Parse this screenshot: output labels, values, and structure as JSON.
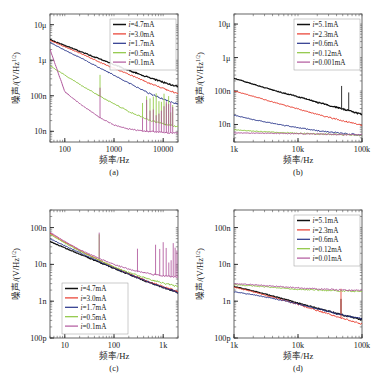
{
  "figure": {
    "axis_labels": {
      "x": "频率/Hz",
      "y": "噪声/(V/Hz",
      "y_sup": "1/2",
      "y_tail": ")"
    },
    "colors": {
      "series1": "#111111",
      "series2": "#e8392a",
      "series3": "#27348b",
      "series4": "#8cc63f",
      "series5": "#b0569c"
    }
  },
  "panels": [
    {
      "id": "a",
      "caption": "(a)",
      "legend_position": "top-right",
      "chart_data": {
        "type": "line",
        "title": "",
        "xlabel": "频率/Hz",
        "ylabel": "噪声/(V/Hz^1/2)",
        "xscale": "log",
        "yscale": "log",
        "xlim": [
          50,
          20000
        ],
        "ylim": [
          5e-09,
          2e-05
        ],
        "xticks": [
          100,
          1000,
          10000
        ],
        "xticklabels": [
          "100",
          "1000",
          "10000"
        ],
        "yticks": [
          1e-05,
          1e-06,
          1e-07,
          1e-08
        ],
        "yticklabels": [
          "10μ",
          "1μ",
          "100n",
          "10n"
        ],
        "grid": false,
        "series": [
          {
            "name": "i=4.7mA",
            "color": "#111111",
            "x": [
              50,
              100,
              200,
              500,
              1000,
              2000,
              5000,
              10000,
              20000
            ],
            "y": [
              3.8e-06,
              2.6e-06,
              1.8e-06,
              1.1e-06,
              7.6e-07,
              5.2e-07,
              3.3e-07,
              2.4e-07,
              1.8e-07
            ]
          },
          {
            "name": "i=3.0mA",
            "color": "#e8392a",
            "x": [
              50,
              100,
              200,
              500,
              1000,
              2000,
              5000,
              10000,
              20000
            ],
            "y": [
              3.6e-06,
              2.4e-06,
              1.6e-06,
              9e-07,
              6e-07,
              4e-07,
              2.3e-07,
              1.6e-07,
              1.15e-07
            ]
          },
          {
            "name": "i=1.7mA",
            "color": "#27348b",
            "x": [
              50,
              100,
              200,
              500,
              1000,
              2000,
              5000,
              10000,
              20000
            ],
            "y": [
              3.2e-06,
              1.9e-06,
              1.2e-06,
              6.2e-07,
              3.8e-07,
              2.3e-07,
              1.2e-07,
              8e-08,
              5.8e-08
            ]
          },
          {
            "name": "i=0.5mA",
            "color": "#8cc63f",
            "x": [
              50,
              100,
              200,
              500,
              1000,
              2000,
              5000,
              10000,
              20000
            ],
            "y": [
              7e-07,
              3.8e-07,
              2.1e-07,
              1e-07,
              6e-08,
              3.6e-08,
              2.1e-08,
              1.6e-08,
              1.35e-08
            ]
          },
          {
            "name": "i=0.1mA",
            "color": "#b0569c",
            "x": [
              50,
              100,
              200,
              500,
              1000,
              2000,
              5000,
              10000,
              20000
            ],
            "y": [
              2e-06,
              1.3e-07,
              6e-08,
              2.5e-08,
              1.5e-08,
              1.15e-08,
              9.8e-09,
              9.3e-09,
              9e-09
            ]
          }
        ],
        "legend": [
          "i=4.7mA",
          "i=3.0mA",
          "i=1.7mA",
          "i=0.5mA",
          "i=0.1mA"
        ],
        "legend_currents": [
          "4.7",
          "3.0",
          "1.7",
          "0.5",
          "0.1"
        ]
      }
    },
    {
      "id": "b",
      "caption": "(b)",
      "legend_position": "top-right",
      "chart_data": {
        "type": "line",
        "title": "",
        "xlabel": "频率/Hz",
        "ylabel": "噪声/(V/Hz^1/2)",
        "xscale": "log",
        "yscale": "log",
        "xlim": [
          1000,
          100000
        ],
        "ylim": [
          3e-09,
          2e-05
        ],
        "xticks": [
          1000,
          10000,
          100000
        ],
        "xticklabels": [
          "1k",
          "10k",
          "100k"
        ],
        "yticks": [
          1e-05,
          1e-06,
          1e-07,
          1e-08
        ],
        "yticklabels": [
          "10μ",
          "1μ",
          "100n",
          "10n"
        ],
        "grid": false,
        "series": [
          {
            "name": "i=5.1mA",
            "color": "#111111",
            "x": [
              1000,
              2000,
              5000,
              10000,
              20000,
              50000,
              100000
            ],
            "y": [
              2.4e-07,
              1.6e-07,
              9.5e-08,
              6.8e-08,
              4.6e-08,
              2.9e-08,
              2e-08
            ]
          },
          {
            "name": "i=2.3mA",
            "color": "#e8392a",
            "x": [
              1000,
              2000,
              5000,
              10000,
              20000,
              50000,
              100000
            ],
            "y": [
              1e-07,
              7e-08,
              4.2e-08,
              2.9e-08,
              2e-08,
              1.3e-08,
              9.5e-09
            ]
          },
          {
            "name": "i=0.6mA",
            "color": "#27348b",
            "x": [
              1000,
              2000,
              5000,
              10000,
              20000,
              50000,
              100000
            ],
            "y": [
              1.9e-08,
              1.4e-08,
              1e-08,
              8e-09,
              6.6e-09,
              5.4e-09,
              4.8e-09
            ]
          },
          {
            "name": "i=0.12mA",
            "color": "#8cc63f",
            "x": [
              1000,
              2000,
              5000,
              10000,
              20000,
              50000,
              100000
            ],
            "y": [
              7e-09,
              6.3e-09,
              5.8e-09,
              5.5e-09,
              5.2e-09,
              5e-09,
              4.8e-09
            ]
          },
          {
            "name": "i=0.001mA",
            "color": "#b0569c",
            "x": [
              1000,
              2000,
              5000,
              10000,
              20000,
              50000,
              100000
            ],
            "y": [
              5.6e-09,
              5.5e-09,
              5.4e-09,
              5.3e-09,
              5.2e-09,
              5e-09,
              4.9e-09
            ]
          }
        ],
        "legend": [
          "i=5.1mA",
          "i=2.3mA",
          "i=0.6mA",
          "i=0.12mA",
          "i=0.001mA"
        ],
        "legend_currents": [
          "5.1",
          "2.3",
          "0.6",
          "0.12",
          "0.001"
        ]
      }
    },
    {
      "id": "c",
      "caption": "(c)",
      "legend_position": "bottom-left",
      "chart_data": {
        "type": "line",
        "title": "",
        "xlabel": "频率/Hz",
        "ylabel": "噪声/(V/Hz^1/2)",
        "xscale": "log",
        "yscale": "log",
        "xlim": [
          5,
          2000
        ],
        "ylim": [
          1e-10,
          3e-07
        ],
        "xticks": [
          10,
          100,
          1000
        ],
        "xticklabels": [
          "10",
          "100",
          "1k"
        ],
        "yticks": [
          1e-07,
          1e-08,
          1e-09,
          1e-10
        ],
        "yticklabels": [
          "100n",
          "10n",
          "1n",
          "100p"
        ],
        "grid": false,
        "series": [
          {
            "name": "i=4.7mA",
            "color": "#111111",
            "x": [
              5,
              10,
              20,
              50,
              100,
              200,
              500,
              1000,
              2000
            ],
            "y": [
              4.2e-08,
              2.8e-08,
              1.9e-08,
              1.15e-08,
              7.8e-09,
              5.4e-09,
              3.3e-09,
              2.4e-09,
              1.7e-09
            ]
          },
          {
            "name": "i=3.0mA",
            "color": "#e8392a",
            "x": [
              5,
              10,
              20,
              50,
              100,
              200,
              500,
              1000,
              2000
            ],
            "y": [
              7e-08,
              4e-08,
              2.4e-08,
              1.3e-08,
              8.4e-09,
              5.6e-09,
              3.4e-09,
              2.5e-09,
              1.8e-09
            ]
          },
          {
            "name": "i=1.7mA",
            "color": "#27348b",
            "x": [
              5,
              10,
              20,
              50,
              100,
              200,
              500,
              1000,
              2000
            ],
            "y": [
              5e-08,
              3.2e-08,
              2.1e-08,
              1.2e-08,
              8e-09,
              5.5e-09,
              3.3e-09,
              2.4e-09,
              1.75e-09
            ]
          },
          {
            "name": "i=0.5mA",
            "color": "#8cc63f",
            "x": [
              5,
              10,
              20,
              50,
              100,
              200,
              500,
              1000,
              2000
            ],
            "y": [
              6.5e-08,
              3.8e-08,
              2.3e-08,
              1.3e-08,
              8.6e-09,
              6e-09,
              4e-09,
              3.1e-09,
              2.5e-09
            ]
          },
          {
            "name": "i=0.1mA",
            "color": "#b0569c",
            "x": [
              5,
              10,
              20,
              50,
              100,
              200,
              500,
              1000,
              2000
            ],
            "y": [
              7.5e-08,
              4.2e-08,
              2.5e-08,
              1.45e-08,
              1e-08,
              7.4e-09,
              5.6e-09,
              4.9e-09,
              4.6e-09
            ]
          }
        ],
        "legend": [
          "i=4.7mA",
          "i=3.0mA",
          "i=1.7mA",
          "i=0.5mA",
          "i=0.1mA"
        ],
        "legend_currents": [
          "4.7",
          "3.0",
          "1.7",
          "0.5",
          "0.1"
        ]
      }
    },
    {
      "id": "d",
      "caption": "(d)",
      "legend_position": "top-right",
      "chart_data": {
        "type": "line",
        "title": "",
        "xlabel": "频率/Hz",
        "ylabel": "噪声/(V/Hz^1/2)",
        "xscale": "log",
        "yscale": "log",
        "xlim": [
          1000,
          100000
        ],
        "ylim": [
          1e-10,
          3e-07
        ],
        "xticks": [
          1000,
          10000,
          100000
        ],
        "xticklabels": [
          "1k",
          "10k",
          "100k"
        ],
        "yticks": [
          1e-07,
          1e-08,
          1e-09,
          1e-10
        ],
        "yticklabels": [
          "100n",
          "10n",
          "1n",
          "100p"
        ],
        "grid": false,
        "series": [
          {
            "name": "i=5.1mA",
            "color": "#111111",
            "x": [
              1000,
              2000,
              5000,
              10000,
              20000,
              50000,
              100000
            ],
            "y": [
              2.5e-09,
              1.9e-09,
              1.25e-09,
              9e-10,
              6.4e-10,
              4.2e-10,
              3.2e-10
            ]
          },
          {
            "name": "i=2.3mA",
            "color": "#e8392a",
            "x": [
              1000,
              2000,
              5000,
              10000,
              20000,
              50000,
              100000
            ],
            "y": [
              2.4e-09,
              1.8e-09,
              1.15e-09,
              8.2e-10,
              5.6e-10,
              3.4e-10,
              2.4e-10
            ]
          },
          {
            "name": "i=0.6mA",
            "color": "#27348b",
            "x": [
              1000,
              2000,
              5000,
              10000,
              20000,
              50000,
              100000
            ],
            "y": [
              1.8e-09,
              1.5e-09,
              1.1e-09,
              8.4e-10,
              6.2e-10,
              4.2e-10,
              3.3e-10
            ]
          },
          {
            "name": "i=0.12mA",
            "color": "#8cc63f",
            "x": [
              1000,
              2000,
              5000,
              10000,
              20000,
              50000,
              100000
            ],
            "y": [
              2.8e-09,
              2.6e-09,
              2.3e-09,
              2.1e-09,
              2e-09,
              1.9e-09,
              1.85e-09
            ]
          },
          {
            "name": "i=0.01mA",
            "color": "#b0569c",
            "x": [
              1000,
              2000,
              5000,
              10000,
              20000,
              50000,
              100000
            ],
            "y": [
              3e-09,
              2.8e-09,
              2.5e-09,
              2.3e-09,
              2.15e-09,
              2e-09,
              1.95e-09
            ]
          }
        ],
        "legend": [
          "i=5.1mA",
          "i=2.3mA",
          "i=0.6mA",
          "i=0.12mA",
          "i=0.01mA"
        ],
        "legend_currents": [
          "5.1",
          "2.3",
          "0.6",
          "0.12",
          "0.01"
        ]
      }
    }
  ]
}
